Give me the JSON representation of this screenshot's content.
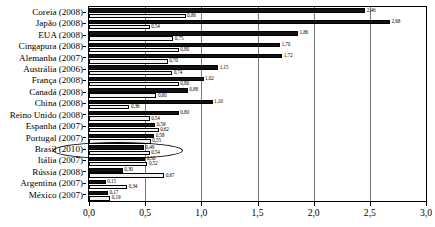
{
  "chart_data": {
    "type": "bar",
    "orientation": "horizontal",
    "title": "",
    "subtitle": "",
    "xlabel": "",
    "ylabel": "",
    "xlim": [
      0.0,
      3.0
    ],
    "grid": true,
    "legend": null,
    "x_tick_labels": [
      "0,0",
      "0,5",
      "1,0",
      "1,5",
      "2,0",
      "2,5",
      "3,0"
    ],
    "x_tick_values": [
      0.0,
      0.5,
      1.0,
      1.5,
      2.0,
      2.5,
      3.0
    ],
    "categories": [
      "Coreia (2008)",
      "Japão (2008)",
      "EUA (2008)",
      "Cingapura (2008)",
      "Alemanha (2007)",
      "Austrália (2006)",
      "França (2008)",
      "Canadá (2008)",
      "China (2008)",
      "Reino Unido (2008)",
      "Espanha (2007)",
      "Portugal (2007)",
      "Brasil (2010)",
      "Itália (2007)",
      "Rússia (2008)",
      "Argentina (2007)",
      "México (2007)"
    ],
    "series": [
      {
        "name": "serie-escura",
        "color": "#111111",
        "values": [
          2.46,
          2.68,
          1.86,
          1.7,
          1.72,
          1.15,
          1.02,
          0.88,
          1.1,
          0.8,
          0.59,
          0.58,
          0.49,
          0.5,
          0.3,
          0.15,
          0.17
        ],
        "labels": [
          "2,46",
          "2,68",
          "1,86",
          "1,70",
          "1,72",
          "1,15",
          "1,02",
          "0,88",
          "1,10",
          "0,80",
          "0,59",
          "0,58",
          "0,49",
          "0,50",
          "0,30",
          "0,15",
          "0,17"
        ]
      },
      {
        "name": "serie-clara",
        "color": "#f2f2f2",
        "values": [
          0.86,
          0.54,
          0.75,
          0.8,
          0.7,
          0.74,
          0.8,
          0.6,
          0.36,
          0.54,
          0.62,
          0.55,
          0.54,
          0.52,
          0.67,
          0.34,
          0.19
        ],
        "labels": [
          "0,86",
          "0,54",
          "0,75",
          "0,80",
          "0,70",
          "0,74",
          "0,80",
          "0,60",
          "0,36",
          "0,54",
          "0,62",
          "0,55",
          "0,54",
          "0,52",
          "0,67",
          "0,34",
          "0,19"
        ]
      }
    ],
    "annotations": [
      {
        "type": "ellipse",
        "target_category": "Brasil (2010)",
        "name": "brasil-highlight-ellipse"
      }
    ]
  }
}
